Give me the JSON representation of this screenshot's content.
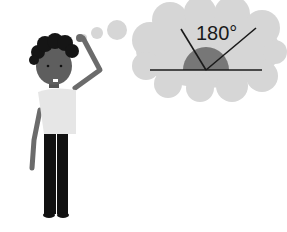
{
  "illustration": {
    "description": "Confused person scratching head, thinking about a straight angle",
    "thought_bubble": {
      "angle_label": "180°"
    }
  }
}
